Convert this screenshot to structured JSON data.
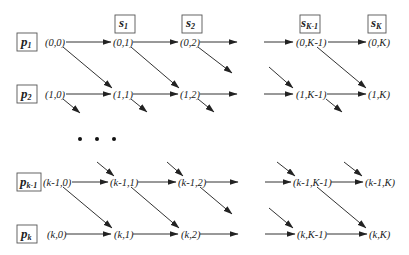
{
  "diagram": {
    "type": "lattice-dag",
    "processors": [
      {
        "base": "p",
        "sub": "1",
        "y": 42
      },
      {
        "base": "p",
        "sub": "2",
        "y": 94
      },
      {
        "base": "p",
        "sub": "k-1",
        "y": 182
      },
      {
        "base": "p",
        "sub": "k",
        "y": 234
      }
    ],
    "stages": [
      {
        "base": "s",
        "sub": "1",
        "x": 125
      },
      {
        "base": "s",
        "sub": "2",
        "x": 192
      },
      {
        "base": "s",
        "sub": "K-1",
        "x": 298
      },
      {
        "base": "s",
        "sub": "K",
        "x": 366
      }
    ],
    "nodes": {
      "row0": [
        "(0,0)",
        "(0,1)",
        "(0,2)",
        "(0,K-1)",
        "(0,K)"
      ],
      "row1": [
        "(1,0)",
        "(1,1)",
        "(1,2)",
        "(1,K-1)",
        "(1,K)"
      ],
      "rowk1": [
        "(k-1,0)",
        "(k-1,1)",
        "(k-1,2)",
        "(k-1,K-1)",
        "(k-1,K)"
      ],
      "rowk": [
        "(k,0)",
        "(k,1)",
        "(k,2)",
        "(k,K-1)",
        "(k,K)"
      ]
    },
    "ellipsis": "• • •"
  }
}
